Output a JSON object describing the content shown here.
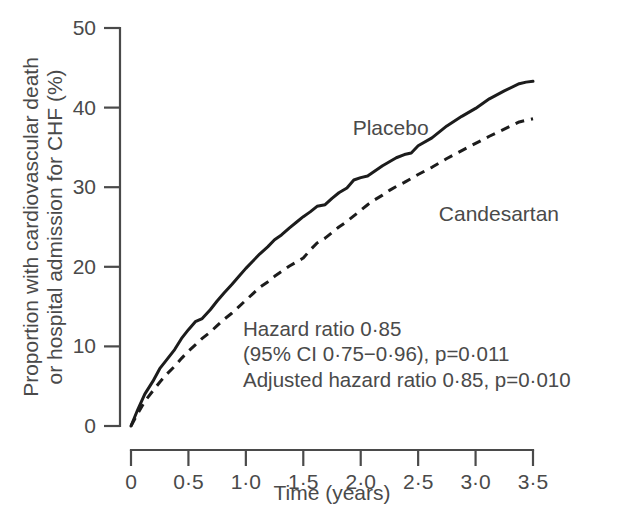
{
  "chart_data": {
    "type": "line",
    "title": "",
    "subtitle": "",
    "xlabel": "Time (years)",
    "ylabel": "Proportion with cardiovascular death or hospital admission for CHF (%)",
    "ylabel_line1": "Proportion with cardiovascular death",
    "ylabel_line2": "or hospital admission for CHF (%)",
    "xlim": [
      0,
      3.5
    ],
    "ylim": [
      0,
      50
    ],
    "xticks": [
      0,
      0.5,
      1.0,
      1.5,
      2.0,
      2.5,
      3.0,
      3.5
    ],
    "xticklabels": [
      "0",
      "0·5",
      "1·0",
      "1·5",
      "2·0",
      "2·5",
      "3·0",
      "3·5"
    ],
    "yticks": [
      0,
      10,
      20,
      30,
      40,
      50
    ],
    "yticklabels": [
      "0",
      "10",
      "20",
      "30",
      "40",
      "50"
    ],
    "grid": false,
    "legend_position": "inline-labels",
    "series": [
      {
        "name": "Placebo",
        "style": "solid",
        "color": "#1c1c1c",
        "label_position": {
          "x": 1.93,
          "y": 36.6
        },
        "x": [
          0,
          0.06,
          0.12,
          0.19,
          0.25,
          0.31,
          0.38,
          0.44,
          0.5,
          0.56,
          0.62,
          0.69,
          0.75,
          0.81,
          0.88,
          0.94,
          1.0,
          1.06,
          1.12,
          1.19,
          1.25,
          1.31,
          1.38,
          1.44,
          1.5,
          1.56,
          1.62,
          1.69,
          1.75,
          1.81,
          1.88,
          1.94,
          2.0,
          2.06,
          2.12,
          2.19,
          2.25,
          2.31,
          2.38,
          2.44,
          2.5,
          2.62,
          2.75,
          2.88,
          3.0,
          3.12,
          3.25,
          3.38,
          3.44,
          3.5
        ],
        "y": [
          0,
          2.1,
          4.0,
          5.6,
          7.2,
          8.3,
          9.6,
          11.0,
          12.1,
          13.1,
          13.5,
          14.6,
          15.7,
          16.7,
          17.8,
          18.8,
          19.8,
          20.7,
          21.6,
          22.5,
          23.4,
          24.0,
          24.9,
          25.6,
          26.3,
          26.9,
          27.6,
          27.8,
          28.6,
          29.3,
          29.9,
          30.9,
          31.2,
          31.4,
          32.0,
          32.7,
          33.2,
          33.7,
          34.1,
          34.3,
          35.2,
          36.2,
          37.7,
          38.9,
          39.9,
          41.1,
          42.1,
          43.0,
          43.2,
          43.3
        ]
      },
      {
        "name": "Candesartan",
        "style": "dashed",
        "color": "#1c1c1c",
        "label_position": {
          "x": 2.68,
          "y": 25.7
        },
        "x": [
          0,
          0.06,
          0.12,
          0.19,
          0.25,
          0.31,
          0.38,
          0.44,
          0.5,
          0.56,
          0.62,
          0.69,
          0.75,
          0.81,
          0.88,
          0.94,
          1.0,
          1.06,
          1.12,
          1.19,
          1.25,
          1.31,
          1.38,
          1.44,
          1.5,
          1.56,
          1.62,
          1.69,
          1.75,
          1.81,
          1.88,
          1.94,
          2.0,
          2.06,
          2.12,
          2.19,
          2.25,
          2.31,
          2.38,
          2.44,
          2.5,
          2.62,
          2.75,
          2.88,
          3.0,
          3.12,
          3.25,
          3.38,
          3.44,
          3.5
        ],
        "y": [
          0,
          1.6,
          3.1,
          4.4,
          5.5,
          6.5,
          7.5,
          8.5,
          9.4,
          10.2,
          11.0,
          11.8,
          12.6,
          13.4,
          14.2,
          15.0,
          15.8,
          16.6,
          17.4,
          18.1,
          18.8,
          19.4,
          20.1,
          20.6,
          21.1,
          22.1,
          23.0,
          23.6,
          24.3,
          25.0,
          25.7,
          26.4,
          27.1,
          27.8,
          28.4,
          29.0,
          29.6,
          30.1,
          30.6,
          31.1,
          31.6,
          32.5,
          33.6,
          34.6,
          35.5,
          36.4,
          37.3,
          38.2,
          38.4,
          38.6
        ]
      }
    ],
    "annotations": [
      {
        "id": "hazard-ratio",
        "text": "Hazard ratio 0·85"
      },
      {
        "id": "confidence-interval",
        "text": "(95% CI 0·75−0·96), p=0·011"
      },
      {
        "id": "adjusted-hazard-ratio",
        "text": "Adjusted hazard ratio 0·85, p=0·010"
      }
    ]
  },
  "labels": {
    "placebo": "Placebo",
    "candesartan": "Candesartan",
    "xlabel": "Time (years)",
    "ylabel_line1": "Proportion with cardiovascular death",
    "ylabel_line2": "or hospital admission for CHF (%)",
    "annot_line1": "Hazard ratio 0·85",
    "annot_line2": "(95% CI 0·75−0·96), p=0·011",
    "annot_line3": "Adjusted hazard ratio 0·85, p=0·010"
  },
  "colors": {
    "axis": "#4a4a4a",
    "curve": "#1c1c1c",
    "text": "#4a4a4a",
    "background": "#ffffff"
  }
}
